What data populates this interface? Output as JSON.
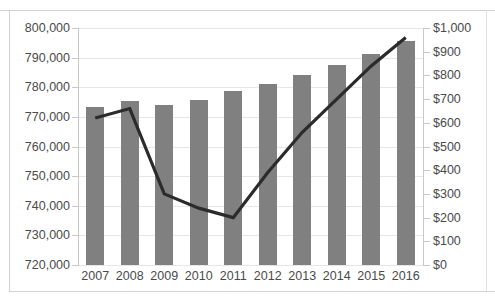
{
  "chart_data": {
    "type": "bar",
    "title": "",
    "subtitle": "",
    "xlabel": "",
    "ylabel": "",
    "grid": true,
    "legend": "none",
    "categories": [
      "2007",
      "2008",
      "2009",
      "2010",
      "2011",
      "2012",
      "2013",
      "2014",
      "2015",
      "2016"
    ],
    "axes": {
      "left": {
        "ylabel": "",
        "ylim": [
          720000,
          800000
        ],
        "tick_step": 10000,
        "ticks": [
          800000,
          790000,
          780000,
          770000,
          760000,
          750000,
          740000,
          730000,
          720000
        ],
        "tick_labels": [
          "800,000",
          "790,000",
          "780,000",
          "770,000",
          "760,000",
          "750,000",
          "740,000",
          "730,000",
          "720,000"
        ]
      },
      "right": {
        "ylabel": "",
        "ylim": [
          0,
          1000
        ],
        "tick_step": 100,
        "ticks": [
          1000,
          900,
          800,
          700,
          600,
          500,
          400,
          300,
          200,
          100,
          0
        ],
        "tick_labels": [
          "$1,000",
          "$900",
          "$800",
          "$700",
          "$600",
          "$500",
          "$400",
          "$300",
          "$200",
          "$100",
          "$0"
        ]
      }
    },
    "series": [
      {
        "name": "bars",
        "chart_type": "bar",
        "axis": "left",
        "color": "#808080",
        "values": [
          773500,
          775200,
          774000,
          775800,
          778700,
          781200,
          784200,
          787500,
          791200,
          795500
        ]
      },
      {
        "name": "line",
        "chart_type": "line",
        "axis": "right",
        "color": "#2b2b2b",
        "values": [
          620,
          660,
          300,
          240,
          200,
          390,
          560,
          700,
          840,
          960
        ]
      }
    ]
  },
  "style": {
    "background": "#ffffff",
    "bar_color": "#808080",
    "line_color": "#2b2b2b",
    "grid_color": "#e6e6e6",
    "axis_color": "#c9c9c9",
    "text_color": "#4a4a4a",
    "frame_color": "#d2d2d2"
  }
}
